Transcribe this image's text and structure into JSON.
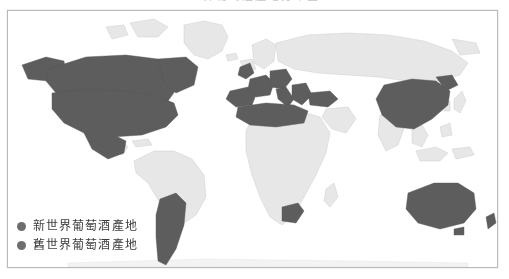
{
  "figure": {
    "title": "世界葡萄酒產地分布圖",
    "frame_border_color": "#b9b9bb",
    "background_color": "#ffffff"
  },
  "map": {
    "projection_note": "world map, grayscale scan",
    "ocean_color": "#ffffff",
    "land_unhighlighted_color": "#e8e8e8",
    "land_highlighted_color": "#595959",
    "coastline_color": "#b0b0b0",
    "highlighted_regions": [
      "North America",
      "United States",
      "Canada",
      "Mexico",
      "Chile",
      "Argentina",
      "France",
      "Spain",
      "Portugal",
      "Italy",
      "Germany",
      "Greece",
      "Turkey",
      "North Africa",
      "South Africa",
      "China",
      "Australia",
      "New Zealand"
    ],
    "unhighlighted_regions": [
      "Brazil",
      "Central Africa",
      "Russia",
      "India",
      "Scandinavia",
      "Greenland"
    ]
  },
  "legend": {
    "items": [
      {
        "label": "新世界葡萄酒產地",
        "swatch_color": "#6d6d6d",
        "swatch_shape": "circle"
      },
      {
        "label": "舊世界葡萄酒產地",
        "swatch_color": "#6d6d6d",
        "swatch_shape": "circle"
      }
    ]
  }
}
